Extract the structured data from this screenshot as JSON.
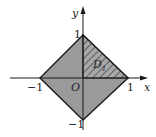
{
  "diagram": {
    "type": "coordinate-region",
    "axes": {
      "x_label": "x",
      "y_label": "y",
      "origin_label": "O"
    },
    "ticks": {
      "x_pos": "1",
      "x_neg": "−1",
      "y_pos": "1",
      "y_neg": "−1"
    },
    "region_label": "D",
    "region_sub": "1",
    "colors": {
      "fill": "#9a9a9a",
      "hatch": "#333333",
      "stroke": "#1a1a1a",
      "background": "#ffffff"
    }
  }
}
